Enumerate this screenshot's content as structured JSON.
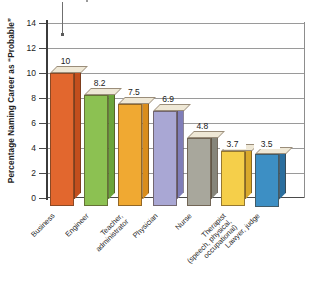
{
  "chart_data": {
    "type": "bar",
    "title": "",
    "subtitle": "",
    "xlabel": "",
    "ylabel": "Percentage Naming Career as “Probable”",
    "ylim": [
      0,
      14
    ],
    "ytick_step": 2,
    "yticks": [
      "0",
      "2",
      "4",
      "6",
      "8",
      "10",
      "12",
      "14"
    ],
    "grid": true,
    "legend": "none",
    "style": "3d-bar",
    "categories": [
      "Business",
      "Engineer",
      "Teacher,\nadministrator",
      "Physician",
      "Nurse",
      "Therapist\n(speech, physical,\noccupational)",
      "Lawyer, judge"
    ],
    "values": [
      10,
      8.2,
      7.5,
      6.9,
      4.8,
      3.7,
      3.5
    ],
    "value_labels": [
      "10",
      "8.2",
      "7.5",
      "6.9",
      "4.8",
      "3.7",
      "3.5"
    ],
    "bar_colors": [
      "#e2672e",
      "#8cc152",
      "#f0a932",
      "#a9a7d4",
      "#a8a79c",
      "#f5cf4a",
      "#3d8fc4"
    ],
    "bar_side_colors": [
      "#c24e1d",
      "#6aa53a",
      "#d98d1c",
      "#7f7db8",
      "#86857a",
      "#d9a92c",
      "#2a6e9e"
    ],
    "bar_top_color": "#efe8d6",
    "axis_color": "#3b3b3b",
    "grid_color": "#9a9a9a",
    "background": "#ffffff"
  }
}
